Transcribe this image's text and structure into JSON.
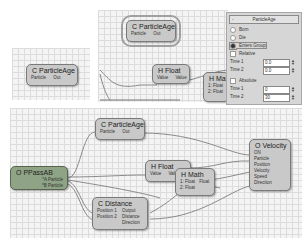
{
  "panels": {
    "small_left": {
      "node": {
        "title": "C ParticleAge",
        "ports": [
          "Particle",
          "Out"
        ]
      }
    },
    "top_right": {
      "highlighted_node": {
        "title": "C ParticleAge",
        "ports": [
          "Particle",
          "Out"
        ]
      },
      "float_node": {
        "title": "H Float",
        "ports": [
          "Value",
          "Value"
        ]
      },
      "math_node_partial": {
        "title": "H Mat",
        "ports": [
          "1: Float",
          "2: Float"
        ]
      }
    },
    "properties": {
      "header": "ParticleAge",
      "collapse_symbol": "-",
      "radio_options": [
        {
          "label": "Born",
          "selected": false
        },
        {
          "label": "Die",
          "selected": false
        },
        {
          "label": "Enters Group",
          "selected": true
        }
      ],
      "relative_label": "Relative",
      "time1_label": "Time 1",
      "time1_value": "0.0",
      "time2_label": "Time 2",
      "time2_value": "0.0",
      "absolute_label": "Absolute",
      "abs_time1_label": "Time 1",
      "abs_time1_value": "0",
      "abs_time2_label": "Time 2",
      "abs_time2_value": "30"
    }
  },
  "graph": {
    "pass_node": {
      "title": "O PPassAB",
      "ports": [
        "*A Particle",
        "*B Particle"
      ]
    },
    "age_node": {
      "title": "C ParticleAge",
      "ports": [
        "Particle",
        "Out"
      ]
    },
    "float_node": {
      "title": "H Float",
      "ports": [
        "Value",
        "Value"
      ]
    },
    "distance_node": {
      "title": "C Distance",
      "inputs": [
        "Position 1",
        "Position 2"
      ],
      "outputs": [
        "Output",
        "Distance",
        "Direction"
      ]
    },
    "math_node": {
      "title": "H Math",
      "inputs": [
        "1: Float",
        "2: Float"
      ],
      "outputs": [
        "Float"
      ]
    },
    "velocity_node": {
      "title": "O Velocity",
      "ports": [
        "ON",
        "Particle",
        "Position",
        "Velocity",
        "Speed",
        "Direction"
      ]
    }
  },
  "colors": {
    "node_gray": "#c9c9c9",
    "node_green": "#8fa486",
    "grid_bg": "#f4f4f4",
    "grid_line": "#dcdcdc"
  }
}
